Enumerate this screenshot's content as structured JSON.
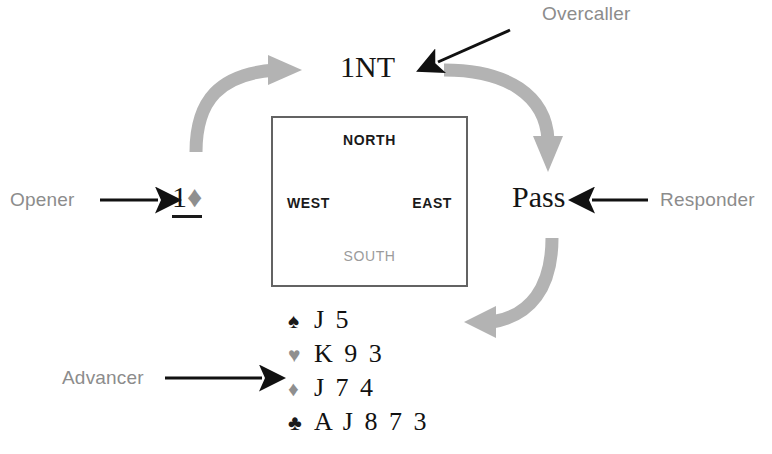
{
  "diagram": {
    "roles": {
      "opener": "Opener",
      "overcaller": "Overcaller",
      "responder": "Responder",
      "advancer": "Advancer"
    },
    "bids": {
      "opener_bid_rank": "1",
      "opener_bid_suit_symbol": "♦",
      "overcaller_bid": "1NT",
      "responder_bid": "Pass"
    },
    "compass": {
      "north": "NORTH",
      "west": "WEST",
      "east": "EAST",
      "south": "SOUTH"
    },
    "hand": {
      "rows": [
        {
          "suit_name": "spades",
          "symbol": "♠",
          "cards": "J 5",
          "color": "#1a1a1a"
        },
        {
          "suit_name": "hearts",
          "symbol": "♥",
          "cards": "K 9 3",
          "color": "#8f8f8f"
        },
        {
          "suit_name": "diamonds",
          "symbol": "♦",
          "cards": "J 7 4",
          "color": "#8f8f8f"
        },
        {
          "suit_name": "clubs",
          "symbol": "♣",
          "cards": "A J 8 7 3",
          "color": "#1a1a1a"
        }
      ]
    },
    "colors": {
      "role_text": "#8c8c8c",
      "bid_text": "#141414",
      "box_border": "#636363",
      "cycle_arrow": "#b3b3b3",
      "pointer_arrow": "#111111",
      "south_label": "#9b9b9b"
    },
    "arrows": {
      "cycle": [
        {
          "name": "opener-to-overcaller",
          "from": "1♦",
          "to": "1NT"
        },
        {
          "name": "overcaller-to-responder",
          "from": "1NT",
          "to": "Pass"
        },
        {
          "name": "responder-to-advancer",
          "from": "Pass",
          "to": "hand"
        }
      ],
      "pointers": [
        {
          "name": "opener-pointer",
          "label": "Opener",
          "direction": "right"
        },
        {
          "name": "overcaller-pointer",
          "label": "Overcaller",
          "direction": "down-left"
        },
        {
          "name": "responder-pointer",
          "label": "Responder",
          "direction": "left"
        },
        {
          "name": "advancer-pointer",
          "label": "Advancer",
          "direction": "right"
        }
      ]
    }
  }
}
